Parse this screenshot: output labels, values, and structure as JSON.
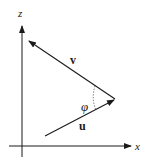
{
  "diagram": {
    "type": "vector-angle-diagram",
    "axes": {
      "vertical": {
        "label": "z"
      },
      "horizontal": {
        "label": "x"
      }
    },
    "vectors": [
      {
        "name": "v",
        "label": "v",
        "direction": "toward upper-left"
      },
      {
        "name": "u",
        "label": "u",
        "direction": "toward upper-right"
      }
    ],
    "angle": {
      "label": "φ",
      "style": "dotted arc",
      "between": [
        "u",
        "v"
      ]
    },
    "colors": {
      "stroke": "#1a1a1a",
      "background": "#ffffff"
    }
  }
}
